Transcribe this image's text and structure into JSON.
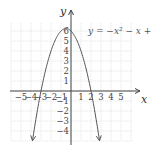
{
  "chart_data": {
    "type": "line",
    "title": "",
    "equation_label": "y = −x² − x + 6",
    "function": "y = -x^2 - x + 6",
    "xlabel": "x",
    "ylabel": "y",
    "xlim": [
      -6,
      6
    ],
    "ylim": [
      -5,
      7
    ],
    "x_ticks": [
      -5,
      -4,
      -3,
      -2,
      -1,
      1,
      2,
      3,
      4,
      5
    ],
    "y_ticks": [
      -4,
      -3,
      -2,
      -1,
      1,
      2,
      3,
      4,
      5,
      6
    ],
    "x_tick_labels": [
      "−5",
      "−4",
      "−3",
      "−2",
      "−1",
      "1",
      "2",
      "3",
      "4",
      "5"
    ],
    "y_tick_labels": [
      "−4",
      "−3",
      "−2",
      "−1",
      "1",
      "2",
      "3",
      "4",
      "5",
      "6"
    ],
    "grid": true,
    "series": [
      {
        "name": "y = −x² − x + 6",
        "x": [
          -3.85,
          -3,
          -2,
          -1,
          -0.5,
          0,
          1,
          2,
          2.85
        ],
        "y": [
          -4.97,
          0,
          4,
          6,
          6.25,
          6,
          4,
          0,
          -4.97
        ],
        "arrows_at_ends": true
      }
    ],
    "key_points": {
      "x_intercepts": [
        -3,
        2
      ],
      "y_intercept": 6,
      "vertex": [
        -0.5,
        6.25
      ]
    }
  }
}
